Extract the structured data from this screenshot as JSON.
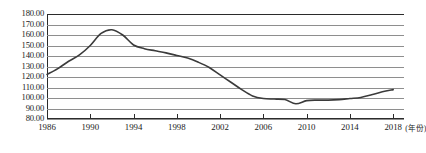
{
  "chart_data": {
    "type": "line",
    "title": "",
    "subtitle": "",
    "xlabel": "(年份)",
    "ylabel": "",
    "xlim": [
      1986,
      2019
    ],
    "ylim": [
      80,
      180
    ],
    "grid": true,
    "legend": null,
    "legend_position": "none",
    "y_tick_labels": [
      "180.00",
      "170.00",
      "160.00",
      "150.00",
      "140.00",
      "130.00",
      "120.00",
      "110.00",
      "100.00",
      "90.00",
      "80.00"
    ],
    "y_ticks": [
      180,
      170,
      160,
      150,
      140,
      130,
      120,
      110,
      100,
      90,
      80
    ],
    "x_tick_labels": [
      "1986",
      "1990",
      "1994",
      "1998",
      "2002",
      "2006",
      "2010",
      "2014",
      "2018"
    ],
    "x_ticks": [
      1986,
      1990,
      1994,
      1998,
      2002,
      2006,
      2010,
      2014,
      2018
    ],
    "series": [
      {
        "name": "",
        "color": "#3b3b3b",
        "x": [
          1986,
          1987,
          1988,
          1989,
          1990,
          1991,
          1992,
          1993,
          1994,
          1995,
          1996,
          1997,
          1998,
          1999,
          2000,
          2001,
          2002,
          2003,
          2004,
          2005,
          2006,
          2007,
          2008,
          2009,
          2010,
          2011,
          2012,
          2013,
          2014,
          2015,
          2016,
          2017,
          2018
        ],
        "values": [
          122.5,
          128.0,
          135.0,
          141.0,
          150.0,
          161.5,
          165.0,
          160.0,
          150.5,
          147.0,
          145.0,
          143.0,
          140.5,
          138.0,
          134.0,
          129.0,
          122.0,
          115.0,
          108.0,
          102.0,
          99.5,
          99.0,
          98.5,
          94.5,
          97.5,
          98.0,
          98.0,
          98.5,
          99.5,
          100.5,
          103.0,
          106.0,
          108.0
        ]
      }
    ]
  }
}
